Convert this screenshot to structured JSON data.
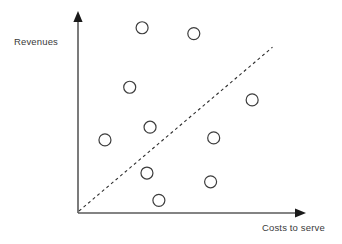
{
  "chart_data": {
    "type": "scatter",
    "title": "",
    "subtitle": "",
    "xlabel": "Costs to serve",
    "ylabel": "Revenues",
    "xtick_labels": [],
    "ytick_labels": [],
    "grid": false,
    "legend": null,
    "legend_position": "none",
    "xlim": [
      0,
      100
    ],
    "ylim": [
      0,
      100
    ],
    "axes_style": "arrow-axes-open",
    "marker": {
      "shape": "circle",
      "filled": false,
      "radius_px": 6,
      "stroke_color": "#3d3d3d",
      "fill_color": "#ffffff",
      "stroke_width_px": 1.2
    },
    "points": [
      {
        "id": "p1",
        "x": 29.0,
        "y": 95.0
      },
      {
        "id": "p2",
        "x": 52.4,
        "y": 92.0
      },
      {
        "id": "p3",
        "x": 23.4,
        "y": 64.5
      },
      {
        "id": "p4",
        "x": 78.8,
        "y": 58.0
      },
      {
        "id": "p5",
        "x": 32.6,
        "y": 44.0
      },
      {
        "id": "p6",
        "x": 12.2,
        "y": 37.5
      },
      {
        "id": "p7",
        "x": 61.4,
        "y": 38.5
      },
      {
        "id": "p8",
        "x": 31.2,
        "y": 20.5
      },
      {
        "id": "p9",
        "x": 60.0,
        "y": 16.0
      },
      {
        "id": "p10",
        "x": 36.6,
        "y": 6.5
      }
    ],
    "reference_line": {
      "label": "",
      "style": "dashed",
      "color": "#2f2f2f",
      "dash_pattern": "3 3",
      "from": {
        "x": 0.0,
        "y": 0.0
      },
      "to": {
        "x": 88.0,
        "y": 85.0
      },
      "description": "break-even diagonal"
    },
    "annotations": []
  },
  "axes": {
    "y_axis_label": "Revenues",
    "x_axis_label": "Costs to serve",
    "axis_color": "#5a5a5a",
    "arrow_color": "#1a1a1a"
  },
  "colors": {
    "background": "#ffffff",
    "axis": "#5a5a5a",
    "text": "#3a3a3a",
    "marker_stroke": "#3d3d3d",
    "reference_line": "#2f2f2f"
  }
}
